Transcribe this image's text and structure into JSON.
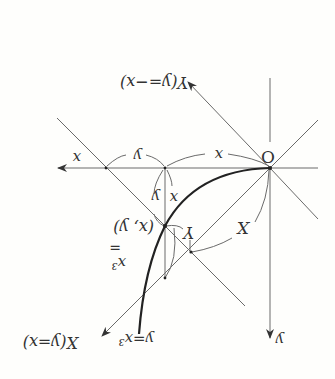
{
  "diagram": {
    "orientation": "rotated 180 degrees",
    "origin_label": "O",
    "axis_labels": {
      "x_axis": "x",
      "y_axis": "y",
      "X_axis": "X(y=x)",
      "Y_axis": "Y(y=−x)"
    },
    "segment_labels": {
      "top_y": "y",
      "top_x": "x",
      "vert_y": "y",
      "vert_x": "x",
      "Y_label": "Y",
      "X_label": "X"
    },
    "point_label": "(x, y)",
    "eq_label_top": "x³",
    "eq_label_eq": "=",
    "curve_label": "y=x³",
    "colors": {
      "line": "#6a6a6a",
      "curve": "#222222",
      "text": "#333333",
      "background": "#fefefc"
    }
  }
}
